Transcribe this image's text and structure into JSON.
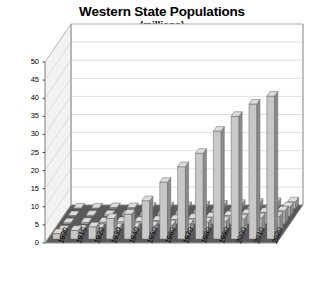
{
  "chart_data": {
    "type": "bar",
    "title": "Western State Populations",
    "subtitle": "(millions)",
    "xlabel": "",
    "ylabel": "",
    "ylim": [
      0,
      50
    ],
    "ytick_step": 5,
    "yticks": [
      0,
      5,
      10,
      15,
      20,
      25,
      30,
      35,
      40,
      45,
      50
    ],
    "grid": true,
    "legend": false,
    "legend_position": "none",
    "projection": "3d",
    "categories": [
      "1900",
      "1910",
      "1920",
      "1930",
      "1940",
      "1950",
      "1960",
      "1970",
      "1980",
      "1990",
      "2000",
      "2010",
      "2020"
    ],
    "series": [
      {
        "name": "Back row",
        "depth_index": 0,
        "values": [
          1.5,
          2.4,
          3.4,
          5.7,
          6.9,
          10.6,
          15.7,
          20.0,
          23.7,
          29.8,
          33.9,
          37.3,
          39.5
        ]
      },
      {
        "name": "Depth row 2",
        "depth_index": 1,
        "values": [
          0.4,
          0.5,
          0.8,
          1.0,
          1.1,
          1.5,
          1.8,
          2.1,
          2.6,
          2.8,
          3.4,
          3.8,
          4.2
        ]
      },
      {
        "name": "Depth row 3",
        "depth_index": 2,
        "values": [
          0.3,
          0.4,
          0.5,
          0.6,
          0.7,
          0.9,
          1.2,
          1.5,
          1.9,
          2.3,
          2.8,
          3.2,
          3.6
        ]
      },
      {
        "name": "Depth row 4",
        "depth_index": 3,
        "values": [
          0.2,
          0.3,
          0.4,
          0.4,
          0.5,
          0.7,
          0.9,
          1.1,
          1.4,
          1.6,
          2.0,
          2.3,
          2.6
        ]
      },
      {
        "name": "Depth row 5",
        "depth_index": 4,
        "values": [
          0.2,
          0.2,
          0.3,
          0.3,
          0.4,
          0.5,
          0.6,
          0.8,
          1.0,
          1.2,
          1.5,
          1.7,
          1.9
        ]
      }
    ]
  },
  "colors": {
    "bar_face": "#c8c8c8",
    "bar_side": "#8c8c8c",
    "bar_top": "#dcdcdc",
    "bar_outline": "#555555",
    "floor": "#5a5a5a",
    "wall_back": "#ffffff",
    "wall_left": "#f2f2f2",
    "gridline": "#c9c9c9",
    "axis_line": "#9a9a9a",
    "text": "#000000",
    "background": "#ffffff"
  }
}
